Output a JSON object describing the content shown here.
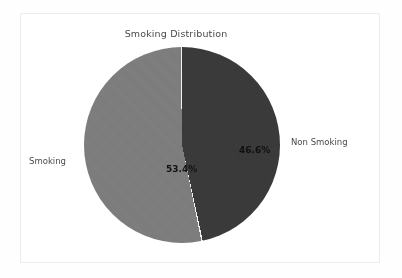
{
  "chart_data": {
    "type": "pie",
    "title": "Smoking Distribution",
    "categories": [
      "Non Smoking",
      "Smoking"
    ],
    "values": [
      46.6,
      53.4
    ],
    "value_labels": [
      "46.6%",
      "53.4%"
    ],
    "unit": "percent",
    "total": 100.0,
    "start_angle_deg": 90,
    "direction": "clockwise",
    "legend": "none",
    "grid": false,
    "slices": [
      {
        "name": "Non Smoking",
        "value": 46.6,
        "label": "46.6%",
        "outside_label": "Non Smoking",
        "color": "#3a3a3a",
        "start_deg": 0,
        "end_deg": 167.8
      },
      {
        "name": "Smoking",
        "value": 53.4,
        "label": "53.4%",
        "outside_label": "Smoking",
        "color": "#7d7d7d",
        "start_deg": 167.8,
        "end_deg": 360
      }
    ]
  },
  "figure": {
    "title": "Smoking Distribution",
    "background": "#ffffff",
    "frame_color": "#ededed",
    "page_background": "#fefefe",
    "separator_color": "#f2f2f2",
    "label_color": "#4a4a4a",
    "value_color": "#121212"
  },
  "labels": {
    "left": "Smoking",
    "right": "Non Smoking",
    "pct_left": "53.4%",
    "pct_right": "46.6%"
  }
}
